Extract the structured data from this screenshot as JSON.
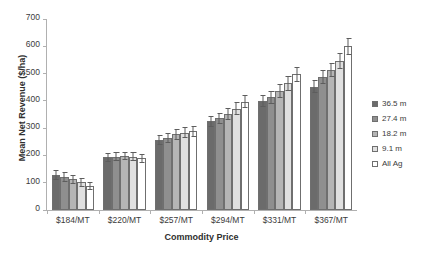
{
  "chart_data": {
    "type": "bar",
    "title": "",
    "xlabel": "Commodity Price",
    "ylabel": "Mean Net Revenue ($/ha)",
    "ylim": [
      0,
      700
    ],
    "yticks": [
      0,
      100,
      200,
      300,
      400,
      500,
      600,
      700
    ],
    "grid": false,
    "legend_position": "right",
    "categories": [
      "$184/MT",
      "$220/MT",
      "$257/MT",
      "$294/MT",
      "$331/MT",
      "$367/MT"
    ],
    "series": [
      {
        "name": "36.5 m",
        "color": "#6b6b6b",
        "values": [
          128,
          193,
          258,
          325,
          398,
          452
        ],
        "errors": [
          18,
          16,
          18,
          20,
          22,
          24
        ]
      },
      {
        "name": "27.4 m",
        "color": "#8f8f8f",
        "values": [
          122,
          196,
          264,
          336,
          413,
          488
        ],
        "errors": [
          18,
          16,
          19,
          21,
          23,
          26
        ]
      },
      {
        "name": "18.2 m",
        "color": "#b5b5b5",
        "values": [
          112,
          198,
          277,
          353,
          437,
          513
        ],
        "errors": [
          17,
          16,
          19,
          22,
          25,
          27
        ]
      },
      {
        "name": "9.1 m",
        "color": "#e0e0e0",
        "values": [
          101,
          196,
          283,
          372,
          464,
          545
        ],
        "errors": [
          16,
          16,
          20,
          23,
          26,
          29
        ]
      },
      {
        "name": "All Ag",
        "color": "#ffffff",
        "values": [
          88,
          190,
          288,
          397,
          498,
          600
        ],
        "errors": [
          16,
          16,
          20,
          24,
          28,
          32
        ]
      }
    ]
  },
  "legend": {
    "items": [
      "36.5 m",
      "27.4 m",
      "18.2 m",
      "9.1 m",
      "All Ag"
    ]
  }
}
